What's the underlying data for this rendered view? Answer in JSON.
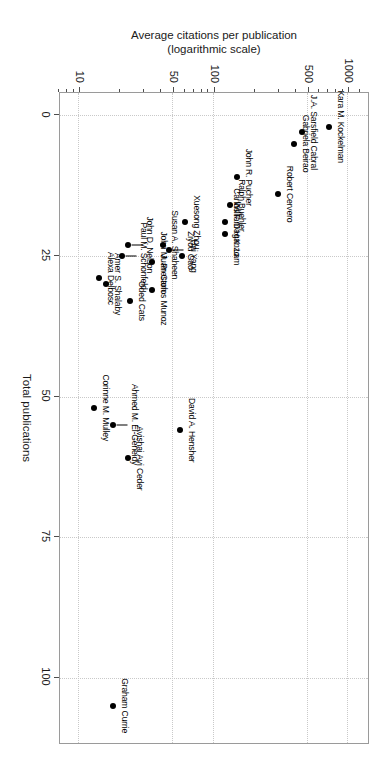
{
  "chart_data": {
    "type": "scatter",
    "title": "",
    "xlabel": "Total publications",
    "ylabel": "Average citations per publication\n(logarithmic scale)",
    "ylabel_line1": "Average citations per publication",
    "ylabel_line2": "(logarithmic scale)",
    "yscale": "log",
    "xscale": "linear",
    "xlim": [
      -4,
      112
    ],
    "ylim": [
      7,
      1400
    ],
    "xticks": [
      0,
      25,
      50,
      75,
      100
    ],
    "xticklabels": [
      "0",
      "25",
      "50",
      "75",
      "100"
    ],
    "yticks": [
      10,
      50,
      100,
      500,
      1000
    ],
    "yticklabels": [
      "10",
      "50",
      "100",
      "500",
      "1000"
    ],
    "y_minor_ticks": [
      7,
      8,
      9,
      20,
      30,
      40,
      60,
      70,
      80,
      90,
      200,
      300,
      400,
      600,
      700,
      800,
      900,
      1200
    ],
    "grid": true,
    "grid_style": "dotted",
    "grid_color": "#c9c9c9",
    "point_color": "#000000",
    "frame_color": "#9a9a9a",
    "points": [
      {
        "label": "Kara M. Kockelman",
        "x": 2,
        "y": 720,
        "anchor": "right"
      },
      {
        "label": "J.A. Sarsfield Cabral",
        "x": 3,
        "y": 455,
        "anchor": "right"
      },
      {
        "label": "Gabriela Beirao",
        "x": 5,
        "y": 395,
        "anchor": "right"
      },
      {
        "label": "Robert Cervero",
        "x": 14,
        "y": 300,
        "anchor": "right"
      },
      {
        "label": "John R. Pucher",
        "x": 11,
        "y": 150,
        "anchor": "right"
      },
      {
        "label": "Ralph Buehler",
        "x": 16,
        "y": 133,
        "anchor": "right"
      },
      {
        "label": "Carlos F. Daganzo",
        "x": 19,
        "y": 122,
        "anchor": "right"
      },
      {
        "label": "William H.K. Lam",
        "x": 21,
        "y": 122,
        "anchor": "right"
      },
      {
        "label": "Xuesong Zhou",
        "x": 19,
        "y": 61,
        "anchor": "right"
      },
      {
        "label": "Hai Yang",
        "x": 25,
        "y": 58,
        "anchor": "right"
      },
      {
        "label": "Susan A. Shaheen",
        "x": 23,
        "y": 42,
        "anchor": "right"
      },
      {
        "label": "Ziyou Gao",
        "x": 24,
        "y": 47,
        "anchor": "right",
        "leader": true
      },
      {
        "label": "Juan Carlos Munoz",
        "x": 31,
        "y": 35,
        "anchor": "right"
      },
      {
        "label": "John M. Preston",
        "x": 26,
        "y": 35,
        "anchor": "right"
      },
      {
        "label": "John D. Nelson",
        "x": 23,
        "y": 23,
        "anchor": "right",
        "leader": true
      },
      {
        "label": "Oded Cats",
        "x": 33,
        "y": 24,
        "anchor": "right"
      },
      {
        "label": "Paul M. Schonfeld",
        "x": 25,
        "y": 21,
        "anchor": "right",
        "leader": true
      },
      {
        "label": "Amer S. Shalaby",
        "x": 30,
        "y": 16,
        "anchor": "right"
      },
      {
        "label": "Alexa Delbosc",
        "x": 29,
        "y": 14,
        "anchor": "right"
      },
      {
        "label": "David A. Hensher",
        "x": 56,
        "y": 56,
        "anchor": "right"
      },
      {
        "label": "Avishai Avi Ceder",
        "x": 61,
        "y": 23,
        "anchor": "right"
      },
      {
        "label": "Ahmed M. El-Geneidy",
        "x": 55,
        "y": 18,
        "anchor": "right",
        "leader": true
      },
      {
        "label": "Corinne M. Mulley",
        "x": 52,
        "y": 13,
        "anchor": "right"
      },
      {
        "label": "Graham Currie",
        "x": 105,
        "y": 18,
        "anchor": "right"
      }
    ]
  },
  "axes": {
    "x_title": "Total publications",
    "y_title_line1": "Average citations per publication",
    "y_title_line2": "(logarithmic scale)"
  }
}
